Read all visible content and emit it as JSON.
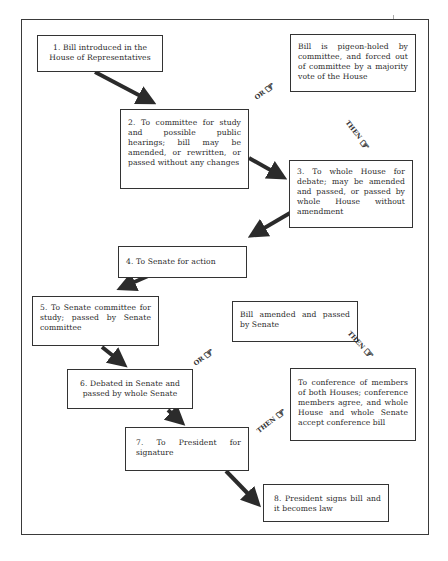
{
  "diagram": {
    "steps": [
      {
        "id": "1",
        "text": "1. Bill introduced in the House of Representatives"
      },
      {
        "id": "2",
        "text": "2. To committee for study and possible public hearings; bill may be amended, or rewritten, or passed without any changes"
      },
      {
        "id": "3",
        "text": "3. To whole House for debate; may be amended and passed, or passed by whole House without amendment"
      },
      {
        "id": "4",
        "text": "4. To Senate for action"
      },
      {
        "id": "5",
        "text": "5. To Senate committee for study; passed by Senate committee"
      },
      {
        "id": "6",
        "text": "6. Debated in Senate and passed by whole Senate"
      },
      {
        "id": "7",
        "text": "7. To President for signature"
      },
      {
        "id": "8",
        "text": "8. President signs bill and it becomes law"
      }
    ],
    "alternates": [
      {
        "id": "pigeonhole",
        "text": "Bill is pigeon-holed by committee, and forced out of committee by a majority vote of the House"
      },
      {
        "id": "senate-amended",
        "text": "Bill amended and passed by Senate"
      },
      {
        "id": "conference",
        "text": "To conference of members of both Houses; conference members agree, and whole House and whole Senate accept conference bill"
      }
    ],
    "connectors": [
      {
        "label": "OR",
        "icon": "pointing-hand-icon"
      },
      {
        "label": "THEN",
        "icon": "pointing-hand-icon"
      },
      {
        "label": "OR",
        "icon": "pointing-hand-icon"
      },
      {
        "label": "THEN",
        "icon": "pointing-hand-icon"
      },
      {
        "label": "THEN",
        "icon": "pointing-hand-icon"
      }
    ],
    "hand_glyph": "☞",
    "colors": {
      "line": "#333333",
      "arrow": "#2b2b2b",
      "background": "#ffffff"
    }
  }
}
